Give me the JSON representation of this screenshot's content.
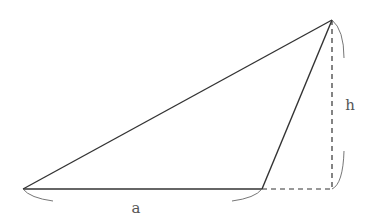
{
  "diagram": {
    "type": "triangle-area",
    "labels": {
      "base": "a",
      "height": "h"
    },
    "vertices": {
      "left": [
        23,
        189
      ],
      "base_right": [
        262,
        189
      ],
      "apex": [
        332,
        20
      ],
      "height_foot": [
        332,
        189
      ]
    },
    "colors": {
      "stroke": "#333333",
      "brace": "#666666",
      "text": "#555555"
    }
  }
}
